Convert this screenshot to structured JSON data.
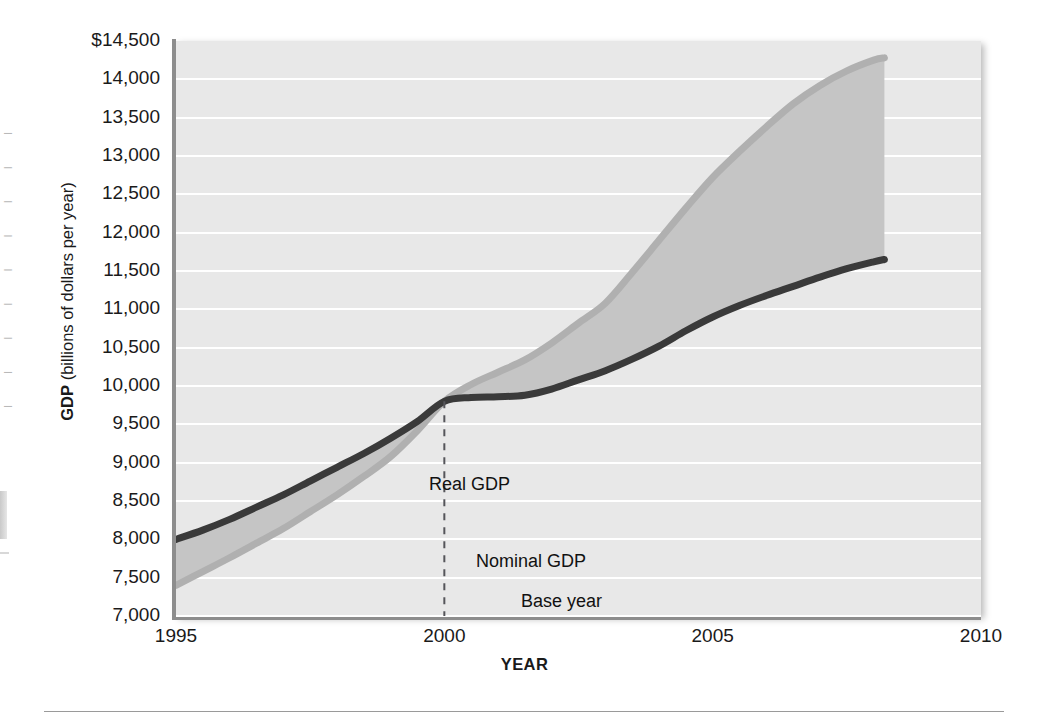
{
  "figure": {
    "background_color": "#ffffff",
    "plot_background_color": "#e8e8e8",
    "gridline_color": "#ffffff",
    "axis_color": "#8d8d8d"
  },
  "edge_artifacts": {
    "fragment_text": "I I I I I I I I I I I I"
  },
  "chart_data": {
    "type": "line",
    "title": "",
    "subtitle": "",
    "xlabel": "YEAR",
    "ylabel": "GDP (billions of dollars per year)",
    "ylabel_bold_part": "GDP",
    "ylabel_regular_part": " (billions of dollars per year)",
    "xlim": [
      1995,
      2010
    ],
    "ylim": [
      7000,
      14500
    ],
    "grid": true,
    "legend_position": "inline-annotations",
    "x_tick_labels": [
      "1995",
      "2000",
      "2005",
      "2010"
    ],
    "x_ticks": [
      1995,
      2000,
      2005,
      2010
    ],
    "y_tick_labels": [
      "$14,500",
      "14,000",
      "13,500",
      "13,000",
      "12,500",
      "12,000",
      "11,500",
      "11,000",
      "10,500",
      "10,000",
      "9,500",
      "9,000",
      "8,500",
      "8,000",
      "7,500",
      "7,000"
    ],
    "y_ticks": [
      14500,
      14000,
      13500,
      13000,
      12500,
      12000,
      11500,
      11000,
      10500,
      10000,
      9500,
      9000,
      8500,
      8000,
      7500,
      7000
    ],
    "fill_between_color": "#c5c5c5",
    "series": [
      {
        "name": "Real GDP",
        "color": "#3a3a3a",
        "line_width": 7,
        "x": [
          1995,
          1995.5,
          1996,
          1996.5,
          1997,
          1997.5,
          1998,
          1998.5,
          1999,
          1999.5,
          2000,
          2000.5,
          2001,
          2001.5,
          2002,
          2002.5,
          2003,
          2003.5,
          2004,
          2004.5,
          2005,
          2005.5,
          2006,
          2006.5,
          2007,
          2007.5,
          2008,
          2008.2
        ],
        "values": [
          8000,
          8120,
          8260,
          8420,
          8580,
          8760,
          8940,
          9120,
          9320,
          9540,
          9800,
          9850,
          9860,
          9880,
          9960,
          10080,
          10200,
          10350,
          10520,
          10720,
          10900,
          11050,
          11180,
          11300,
          11420,
          11530,
          11620,
          11650
        ]
      },
      {
        "name": "Nominal GDP",
        "color": "#b0b0b0",
        "line_width": 7,
        "x": [
          1995,
          1995.5,
          1996,
          1996.5,
          1997,
          1997.5,
          1998,
          1998.5,
          1999,
          1999.5,
          2000,
          2000.5,
          2001,
          2001.5,
          2002,
          2002.5,
          2003,
          2003.5,
          2004,
          2004.5,
          2005,
          2005.5,
          2006,
          2006.5,
          2007,
          2007.5,
          2008,
          2008.2
        ],
        "values": [
          7400,
          7580,
          7760,
          7950,
          8140,
          8360,
          8580,
          8820,
          9080,
          9420,
          9800,
          10020,
          10180,
          10340,
          10560,
          10820,
          11080,
          11480,
          11900,
          12320,
          12720,
          13060,
          13380,
          13680,
          13920,
          14110,
          14250,
          14280
        ]
      }
    ],
    "annotations": [
      {
        "text": "Real GDP",
        "x": 1996.5,
        "y": 9050
      },
      {
        "text": "Nominal GDP",
        "x": 1997.5,
        "y": 8050
      },
      {
        "text": "Base year",
        "x": 1998.5,
        "y": 7550
      }
    ],
    "reference_line": {
      "label": "Base year",
      "x": 2000,
      "style": "dashed",
      "color": "#55555a",
      "from_y": 7000,
      "to_y": 9800
    }
  }
}
